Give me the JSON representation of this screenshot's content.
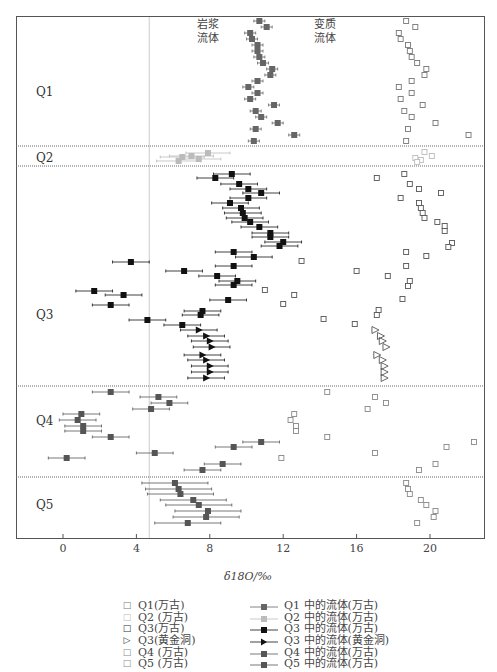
{
  "chart_data": {
    "type": "scatter",
    "title": "",
    "xlabel": "δ18O/‰",
    "ylabel": "",
    "xlim": [
      -2.5,
      23
    ],
    "xticks": [
      0,
      4,
      8,
      12,
      16,
      20
    ],
    "grid": false,
    "reference_line_x": 4.7,
    "annotations": [
      {
        "text_line1": "岩浆",
        "text_line2": "流体",
        "x": 7.9
      },
      {
        "text_line1": "变质",
        "text_line2": "流体",
        "x": 14.3
      }
    ],
    "groups": [
      {
        "label": "Q1",
        "y_top": 16,
        "y_bottom": 146,
        "label_y": 92
      },
      {
        "label": "Q2",
        "y_top": 146,
        "y_bottom": 166,
        "label_y": 158
      },
      {
        "label": "Q3",
        "y_top": 166,
        "y_bottom": 386,
        "label_y": 315
      },
      {
        "label": "Q4",
        "y_top": 386,
        "y_bottom": 477,
        "label_y": 421
      },
      {
        "label": "Q5",
        "y_top": 477,
        "y_bottom": 538,
        "label_y": 505
      }
    ],
    "series": [
      {
        "name": "Q1(万古)",
        "kind": "rock",
        "marker": "square-open",
        "color": "#777777",
        "points": [
          [
            18.7,
            21
          ],
          [
            19.2,
            27
          ],
          [
            18.3,
            33
          ],
          [
            18.4,
            39
          ],
          [
            18.8,
            45
          ],
          [
            18.9,
            51
          ],
          [
            19.0,
            57
          ],
          [
            19.3,
            63
          ],
          [
            19.8,
            69
          ],
          [
            19.7,
            75
          ],
          [
            19.0,
            81
          ],
          [
            18.3,
            87
          ],
          [
            19.0,
            93
          ],
          [
            18.4,
            99
          ],
          [
            19.6,
            105
          ],
          [
            18.6,
            111
          ],
          [
            19.0,
            117
          ],
          [
            20.3,
            123
          ],
          [
            18.8,
            129
          ],
          [
            22.1,
            135
          ],
          [
            18.7,
            141
          ]
        ]
      },
      {
        "name": "Q1 中的流体(万古)",
        "kind": "fluid",
        "marker": "square-filled",
        "color": "#666666",
        "err": 0.3,
        "points": [
          [
            10.7,
            21
          ],
          [
            11.1,
            27
          ],
          [
            10.2,
            33
          ],
          [
            10.3,
            39
          ],
          [
            10.6,
            45
          ],
          [
            10.6,
            51
          ],
          [
            10.7,
            57
          ],
          [
            10.9,
            63
          ],
          [
            11.4,
            69
          ],
          [
            11.3,
            75
          ],
          [
            10.6,
            81
          ],
          [
            10.1,
            87
          ],
          [
            10.6,
            93
          ],
          [
            10.2,
            99
          ],
          [
            11.5,
            105
          ],
          [
            10.5,
            111
          ],
          [
            10.8,
            117
          ],
          [
            11.7,
            123
          ],
          [
            10.5,
            129
          ],
          [
            12.6,
            135
          ],
          [
            10.4,
            141
          ]
        ]
      },
      {
        "name": "Q2 (万古)",
        "kind": "rock",
        "marker": "square-open",
        "color": "#bbbbbb",
        "points": [
          [
            19.7,
            152
          ],
          [
            20.1,
            156
          ],
          [
            19.2,
            158
          ],
          [
            19.5,
            160
          ],
          [
            19.3,
            162
          ]
        ]
      },
      {
        "name": "Q2 中的流体(万古)",
        "kind": "fluid",
        "marker": "square-filled",
        "color": "#bbbbbb",
        "err": 1.2,
        "points": [
          [
            7.9,
            153
          ],
          [
            6.5,
            157
          ],
          [
            7.0,
            156
          ],
          [
            6.3,
            161
          ],
          [
            7.4,
            159
          ]
        ]
      },
      {
        "name": "Q3(万古)",
        "kind": "rock",
        "marker": "square-open",
        "color": "#555555",
        "points": [
          [
            18.6,
            174
          ],
          [
            17.1,
            178
          ],
          [
            18.9,
            184
          ],
          [
            19.4,
            189
          ],
          [
            20.6,
            193
          ],
          [
            18.4,
            198
          ],
          [
            19.4,
            203
          ],
          [
            19.5,
            208
          ],
          [
            19.6,
            213
          ],
          [
            19.7,
            218
          ],
          [
            20.4,
            222
          ],
          [
            20.8,
            226
          ],
          [
            20.8,
            231
          ],
          [
            21.2,
            243
          ],
          [
            21.0,
            247
          ],
          [
            18.7,
            252
          ],
          [
            19.8,
            256
          ],
          [
            13.0,
            261
          ],
          [
            16.0,
            271
          ],
          [
            17.7,
            276
          ],
          [
            18.7,
            266
          ],
          [
            18.9,
            281
          ],
          [
            18.8,
            286
          ],
          [
            11.0,
            290
          ],
          [
            12.6,
            295
          ],
          [
            12.0,
            304
          ],
          [
            18.5,
            299
          ],
          [
            17.2,
            310
          ],
          [
            17.1,
            315
          ],
          [
            14.2,
            319
          ],
          [
            15.9,
            324
          ]
        ]
      },
      {
        "name": "Q3 中的流体(万古)",
        "kind": "fluid",
        "marker": "square-filled",
        "color": "#111111",
        "err": 1.0,
        "points": [
          [
            9.2,
            174
          ],
          [
            8.3,
            178
          ],
          [
            9.6,
            184
          ],
          [
            10.1,
            189
          ],
          [
            10.8,
            193
          ],
          [
            10.1,
            198
          ],
          [
            9.1,
            203
          ],
          [
            9.7,
            208
          ],
          [
            9.8,
            213
          ],
          [
            9.9,
            218
          ],
          [
            10.2,
            222
          ],
          [
            10.7,
            227
          ],
          [
            11.3,
            233
          ],
          [
            11.3,
            237
          ],
          [
            12.0,
            242
          ],
          [
            11.8,
            246
          ],
          [
            10.4,
            257
          ],
          [
            9.3,
            252
          ],
          [
            3.7,
            262
          ],
          [
            9.3,
            266
          ],
          [
            6.6,
            271
          ],
          [
            8.4,
            276
          ],
          [
            9.5,
            281
          ],
          [
            9.3,
            285
          ],
          [
            1.7,
            291
          ],
          [
            3.3,
            295
          ],
          [
            2.6,
            305
          ],
          [
            9.0,
            300
          ],
          [
            7.6,
            311
          ],
          [
            7.5,
            315
          ],
          [
            4.6,
            320
          ],
          [
            6.5,
            325
          ]
        ]
      },
      {
        "name": "Q3(黄金洞)",
        "kind": "rock",
        "marker": "triangle-open",
        "color": "#555555",
        "points": [
          [
            17.0,
            330
          ],
          [
            17.3,
            336
          ],
          [
            17.4,
            341
          ],
          [
            17.6,
            347
          ],
          [
            17.1,
            355
          ],
          [
            17.4,
            360
          ],
          [
            17.5,
            366
          ],
          [
            17.5,
            372
          ],
          [
            17.5,
            378
          ]
        ]
      },
      {
        "name": "Q3 中的流体(黄金洞)",
        "kind": "fluid",
        "marker": "triangle-filled",
        "color": "#111111",
        "err": 1.0,
        "points": [
          [
            7.4,
            330
          ],
          [
            7.8,
            336
          ],
          [
            8.0,
            341
          ],
          [
            8.1,
            347
          ],
          [
            7.6,
            355
          ],
          [
            7.8,
            360
          ],
          [
            8.0,
            366
          ],
          [
            8.0,
            372
          ],
          [
            7.8,
            378
          ]
        ]
      },
      {
        "name": "Q4 (万古)",
        "kind": "rock",
        "marker": "square-open",
        "color": "#888888",
        "points": [
          [
            14.4,
            392
          ],
          [
            17.0,
            397
          ],
          [
            17.6,
            403
          ],
          [
            16.6,
            409
          ],
          [
            12.6,
            414
          ],
          [
            12.4,
            420
          ],
          [
            12.7,
            426
          ],
          [
            12.7,
            431
          ],
          [
            14.4,
            437
          ],
          [
            22.4,
            442
          ],
          [
            20.9,
            447
          ],
          [
            17.0,
            453
          ],
          [
            11.9,
            458
          ],
          [
            20.3,
            464
          ],
          [
            19.4,
            470
          ]
        ]
      },
      {
        "name": "Q4 中的流体(万古)",
        "kind": "fluid",
        "marker": "square-filled",
        "color": "#555555",
        "err": 1.0,
        "points": [
          [
            2.6,
            392
          ],
          [
            5.2,
            397
          ],
          [
            5.8,
            403
          ],
          [
            4.8,
            409
          ],
          [
            1.0,
            414
          ],
          [
            0.8,
            420
          ],
          [
            1.1,
            426
          ],
          [
            1.1,
            431
          ],
          [
            2.6,
            437
          ],
          [
            10.8,
            442
          ],
          [
            9.3,
            447
          ],
          [
            5.0,
            453
          ],
          [
            0.2,
            458
          ],
          [
            8.7,
            464
          ],
          [
            7.6,
            470
          ]
        ]
      },
      {
        "name": "Q5 (万古)",
        "kind": "rock",
        "marker": "square-open",
        "color": "#888888",
        "points": [
          [
            18.7,
            483
          ],
          [
            18.8,
            489
          ],
          [
            18.9,
            494
          ],
          [
            19.5,
            500
          ],
          [
            19.8,
            505
          ],
          [
            20.3,
            511
          ],
          [
            20.2,
            517
          ],
          [
            19.3,
            523
          ]
        ]
      },
      {
        "name": "Q5 中的流体(万古)",
        "kind": "fluid",
        "marker": "square-filled",
        "color": "#555555",
        "err": 1.8,
        "points": [
          [
            6.1,
            483
          ],
          [
            6.3,
            489
          ],
          [
            6.4,
            494
          ],
          [
            7.1,
            500
          ],
          [
            7.4,
            505
          ],
          [
            7.9,
            511
          ],
          [
            7.8,
            517
          ],
          [
            6.8,
            523
          ]
        ]
      }
    ]
  },
  "legend": {
    "left": [
      {
        "label": "Q1(万古)",
        "symbol": "□",
        "color": "#777777"
      },
      {
        "label": "Q2 (万古)",
        "symbol": "□",
        "color": "#bbbbbb"
      },
      {
        "label": "Q3(万古)",
        "symbol": "□",
        "color": "#333333"
      },
      {
        "label": "Q3(黄金洞)",
        "symbol": "▷",
        "color": "#333333"
      },
      {
        "label": "Q4 (万古)",
        "symbol": "□",
        "color": "#888888"
      },
      {
        "label": "Q5 (万古)",
        "symbol": "□",
        "color": "#888888"
      }
    ],
    "right": [
      {
        "label": "Q1 中的流体(万古)",
        "marker": "square",
        "color": "#666666"
      },
      {
        "label": "Q2 中的流体(万古)",
        "marker": "square",
        "color": "#bbbbbb"
      },
      {
        "label": "Q3 中的流体(万古)",
        "marker": "square",
        "color": "#111111"
      },
      {
        "label": "Q3 中的流体(黄金洞)",
        "marker": "triangle",
        "color": "#111111"
      },
      {
        "label": "Q4 中的流体(万古)",
        "marker": "square",
        "color": "#555555"
      },
      {
        "label": "Q5 中的流体(万古)",
        "marker": "square",
        "color": "#555555"
      }
    ]
  }
}
